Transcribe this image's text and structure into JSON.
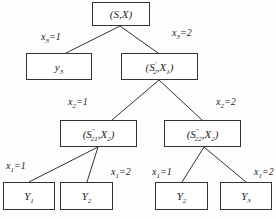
{
  "diagram": {
    "type": "decision-tree",
    "nodes": {
      "root": {
        "label": "(S,X)"
      },
      "y3_leaf": {
        "label": "y3"
      },
      "s2": {
        "label": "(S'2,X1)"
      },
      "s21": {
        "label": "(S''21,X2)"
      },
      "s22": {
        "label": "(S''22,X2)"
      },
      "leaf1": {
        "label": "Y1"
      },
      "leaf2": {
        "label": "Y2"
      },
      "leaf3": {
        "label": "Y2"
      },
      "leaf4": {
        "label": "Y3"
      }
    },
    "edges": [
      {
        "from": "root",
        "to": "y3_leaf",
        "label": "x3=1"
      },
      {
        "from": "root",
        "to": "s2",
        "label": "x3=2"
      },
      {
        "from": "s2",
        "to": "s21",
        "label": "x2=1"
      },
      {
        "from": "s2",
        "to": "s22",
        "label": "x2=2"
      },
      {
        "from": "s21",
        "to": "leaf1",
        "label": "x1=1"
      },
      {
        "from": "s21",
        "to": "leaf2",
        "label": "x1=2"
      },
      {
        "from": "s22",
        "to": "leaf3",
        "label": "x1=1"
      },
      {
        "from": "s22",
        "to": "leaf4",
        "label": "x1=2"
      }
    ]
  }
}
